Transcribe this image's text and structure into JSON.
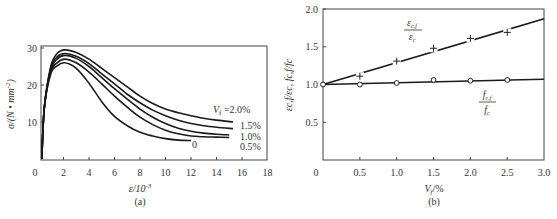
{
  "chart_data": [
    {
      "id": "a",
      "type": "line",
      "caption": "(a)",
      "title": "",
      "xlabel": "ε/10⁻³",
      "ylabel": "σ/(N·mm⁻²)",
      "xlim": [
        0,
        18
      ],
      "ylim": [
        0,
        30
      ],
      "xticks": [
        0,
        2,
        4,
        6,
        8,
        10,
        12,
        14,
        16,
        18
      ],
      "yticks": [
        10,
        20,
        30
      ],
      "grid": false,
      "legend_position": "inline labels at curve ends",
      "series": [
        {
          "name": "V_f=2.0%",
          "label": "V",
          "label_sub": "f",
          "label_rest": " =2.0%",
          "x": [
            0.3,
            0.5,
            1.0,
            1.5,
            2.1,
            3.0,
            4.0,
            5.0,
            6.0,
            7.0,
            8.0,
            9.0,
            10.0,
            11.0,
            12.0,
            13.0,
            14.0,
            15.3
          ],
          "y": [
            0,
            14,
            25,
            28.5,
            29.5,
            28.8,
            27,
            24.5,
            22,
            19.5,
            17,
            15,
            13.5,
            12.5,
            11.7,
            11,
            10.5,
            10
          ]
        },
        {
          "name": "1.5%",
          "label": "1.5%",
          "x": [
            0.3,
            0.5,
            1.0,
            1.5,
            2.1,
            3.0,
            4.0,
            5.0,
            6.0,
            7.0,
            8.0,
            9.0,
            10.0,
            11.0,
            12.0,
            13.0,
            14.0,
            15.3
          ],
          "y": [
            0,
            14,
            24.5,
            27.6,
            28.5,
            27.8,
            25.8,
            23,
            20.3,
            17.5,
            15.2,
            13.2,
            11.7,
            10.5,
            9.6,
            9,
            8.6,
            8.2
          ]
        },
        {
          "name": "1.0%",
          "label": "1.0%",
          "x": [
            0.3,
            0.5,
            1.0,
            1.5,
            2.1,
            3.0,
            4.0,
            5.0,
            6.0,
            7.0,
            8.0,
            9.0,
            10.0,
            11.0,
            12.0,
            13.0,
            14.0,
            15.0
          ],
          "y": [
            0,
            14,
            24,
            27,
            28,
            27.2,
            25,
            22,
            19,
            16.2,
            13.5,
            11.3,
            9.6,
            8.3,
            7.5,
            7,
            6.7,
            6.5
          ]
        },
        {
          "name": "0.5%",
          "label": "0.5%",
          "x": [
            0.3,
            0.5,
            1.0,
            1.5,
            2.1,
            3.0,
            4.0,
            5.0,
            6.0,
            7.0,
            8.0,
            9.0,
            10.0,
            11.0,
            12.0,
            13.0,
            14.0,
            15.0
          ],
          "y": [
            0,
            14,
            23.5,
            26,
            27,
            26,
            23.5,
            20.3,
            17,
            14,
            11.3,
            9.3,
            7.8,
            6.8,
            6.2,
            6,
            5.9,
            5.8
          ]
        },
        {
          "name": "0",
          "label": "0",
          "x": [
            0.3,
            0.5,
            1.0,
            1.5,
            2.1,
            3.0,
            4.0,
            5.0,
            6.0,
            7.0,
            8.0,
            9.0,
            10.0,
            11.0,
            12.0
          ],
          "y": [
            0,
            14,
            23,
            25.2,
            26,
            24.5,
            20.5,
            15.5,
            11.5,
            9,
            7.2,
            6.2,
            5.5,
            5.1,
            5.0
          ]
        }
      ]
    },
    {
      "id": "b",
      "type": "line",
      "caption": "(b)",
      "title": "",
      "xlabel": "V_f/%",
      "ylabel": "ε_c,f/ε_c, f_c,f/f_c",
      "xlim": [
        0,
        3.0
      ],
      "ylim": [
        0,
        2.0
      ],
      "xticks": [
        "0",
        "0.5",
        "1.0",
        "1.5",
        "2.0",
        "2.5",
        "3.0"
      ],
      "yticks": [
        "0.5",
        "1.0",
        "1.5",
        "2.0"
      ],
      "grid": false,
      "legend_position": "inline fraction labels",
      "series": [
        {
          "name": "ε_c,f/ε_c",
          "marker": "+",
          "label_num": "ε",
          "label_num_sub": "c,f",
          "label_den": "ε",
          "label_den_sub": "c",
          "points_x": [
            0,
            0.5,
            1.0,
            1.5,
            2.0,
            2.5
          ],
          "points_y": [
            1.0,
            1.11,
            1.31,
            1.48,
            1.61,
            1.69
          ],
          "fit_line": {
            "x": [
              0,
              3.0
            ],
            "y": [
              1.0,
              1.87
            ]
          }
        },
        {
          "name": "f_c,f/f_c",
          "marker": "o",
          "label_num": "f",
          "label_num_sub": "c,f",
          "label_den": "f",
          "label_den_sub": "c",
          "points_x": [
            0,
            0.5,
            1.0,
            1.5,
            2.0,
            2.5
          ],
          "points_y": [
            1.0,
            1.0,
            1.02,
            1.06,
            1.05,
            1.06
          ],
          "fit_line": {
            "x": [
              0,
              3.0
            ],
            "y": [
              1.0,
              1.07
            ]
          }
        }
      ]
    }
  ],
  "labels": {
    "a": {
      "caption": "(a)",
      "xlabel_main": "ε/10",
      "xlabel_exp": "-3",
      "ylabel_main": "σ/(N • mm",
      "ylabel_exp": "-2",
      "ylabel_close": ")",
      "yticks": [
        "10",
        "20",
        "30"
      ],
      "xticks": [
        "0",
        "2",
        "4",
        "6",
        "8",
        "10",
        "12",
        "14",
        "16",
        "18"
      ],
      "curve_labels": {
        "v20_main": "V",
        "v20_sub": "f",
        "v20_rest": " =2.0%",
        "v15": "1.5%",
        "v10": "1.0%",
        "v05": "0.5%",
        "v0": "0"
      }
    },
    "b": {
      "caption": "(b)",
      "xlabel_main": "V",
      "xlabel_sub": "f",
      "xlabel_rest": "/%",
      "ylabel_text": "εc,f/εc, fc,f/fc",
      "yticks": [
        "0.5",
        "1.0",
        "1.5",
        "2.0"
      ],
      "xticks": [
        "0",
        "0.5",
        "1.0",
        "1.5",
        "2.0",
        "2.5",
        "3.0"
      ],
      "eps_num": "ε",
      "eps_num_sub": "c,f",
      "eps_den": "ε",
      "eps_den_sub": "c",
      "f_num": "f",
      "f_num_sub": "c,f",
      "f_den": "f",
      "f_den_sub": "c"
    }
  }
}
